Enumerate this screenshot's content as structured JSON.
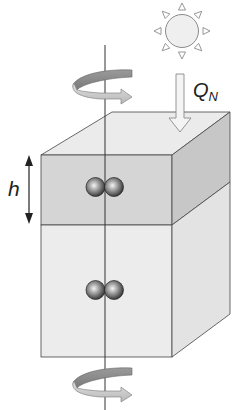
{
  "diagram": {
    "type": "schematic",
    "labels": {
      "h": "h",
      "heat_flux_main": "Q",
      "heat_flux_sub": "N"
    },
    "elements": [
      {
        "id": "sun",
        "kind": "sun-icon"
      },
      {
        "id": "heat-arrow",
        "kind": "down-arrow",
        "label": "Q_N"
      },
      {
        "id": "rotation-top",
        "kind": "curved-arrow",
        "direction": "counter-clockwise (viewed from above)"
      },
      {
        "id": "rotation-bottom",
        "kind": "curved-arrow",
        "direction": "counter-clockwise (viewed from above)"
      },
      {
        "id": "rotation-axis",
        "kind": "vertical-line"
      },
      {
        "id": "upper-layer",
        "kind": "box-layer",
        "shade": "darker",
        "thickness_label": "h"
      },
      {
        "id": "lower-layer",
        "kind": "box-layer",
        "shade": "lighter"
      },
      {
        "id": "particle-pair-upper",
        "kind": "two-spheres"
      },
      {
        "id": "particle-pair-lower",
        "kind": "two-spheres"
      },
      {
        "id": "h-dimension-arrow",
        "kind": "double-headed-arrow"
      }
    ],
    "colors": {
      "top_face": "#ebebeb",
      "upper_front": "#d5d5d5",
      "upper_side": "#c7c7c7",
      "lower_front": "#ececec",
      "lower_side": "#e3e3e3",
      "outline": "#444444",
      "arrow_fill": "#f2f2f2",
      "rotation_arrow_dark": "#8c8c8c",
      "rotation_arrow_light": "#cfcfcf",
      "sun_fill": "#efefef"
    }
  }
}
